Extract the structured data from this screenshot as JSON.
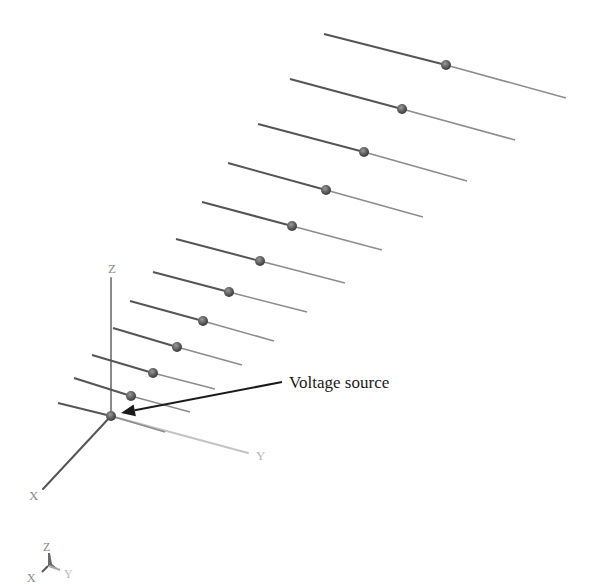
{
  "figure": {
    "annotation": {
      "label": "Voltage source",
      "text_pos": [
        289,
        388
      ],
      "arrow_from": [
        282,
        382
      ],
      "arrow_to": [
        121,
        413
      ]
    },
    "axes": {
      "origin": [
        111,
        416
      ],
      "z": {
        "label": "Z",
        "end": [
          111,
          278
        ],
        "label_pos": [
          108,
          273
        ]
      },
      "y": {
        "label": "Y",
        "end": [
          248,
          453
        ],
        "label_pos": [
          256,
          460
        ]
      },
      "x": {
        "label": "X",
        "end": [
          43,
          489
        ],
        "label_pos": [
          29,
          500
        ]
      }
    },
    "orientation_triad": {
      "z_label": "Z",
      "x_label": "X",
      "y_label": "Y"
    },
    "elements": [
      {
        "id": 1,
        "left": [
          324,
          34
        ],
        "feed": [
          446,
          65
        ],
        "right": [
          566,
          98
        ]
      },
      {
        "id": 2,
        "left": [
          290,
          79
        ],
        "feed": [
          402,
          109
        ],
        "right": [
          515,
          140
        ]
      },
      {
        "id": 3,
        "left": [
          258,
          124
        ],
        "feed": [
          364,
          152
        ],
        "right": [
          467,
          181
        ]
      },
      {
        "id": 4,
        "left": [
          228,
          163
        ],
        "feed": [
          326,
          190
        ],
        "right": [
          423,
          217
        ]
      },
      {
        "id": 5,
        "left": [
          202,
          202
        ],
        "feed": [
          292,
          226
        ],
        "right": [
          382,
          250
        ]
      },
      {
        "id": 6,
        "left": [
          176,
          239
        ],
        "feed": [
          260,
          261
        ],
        "right": [
          345,
          283
        ]
      },
      {
        "id": 7,
        "left": [
          153,
          272
        ],
        "feed": [
          229,
          292
        ],
        "right": [
          307,
          312
        ]
      },
      {
        "id": 8,
        "left": [
          130,
          301
        ],
        "feed": [
          203,
          321
        ],
        "right": [
          274,
          341
        ]
      },
      {
        "id": 9,
        "left": [
          113,
          328
        ],
        "feed": [
          177,
          347
        ],
        "right": [
          242,
          365
        ]
      },
      {
        "id": 10,
        "left": [
          92,
          355
        ],
        "feed": [
          153,
          373
        ],
        "right": [
          215,
          389
        ]
      },
      {
        "id": 11,
        "left": [
          74,
          378
        ],
        "feed": [
          131,
          396
        ],
        "right": [
          190,
          412
        ]
      },
      {
        "id": 12,
        "left": [
          58,
          403
        ],
        "feed": [
          111,
          416
        ],
        "right": [
          165,
          432
        ]
      }
    ],
    "colors": {
      "element_dark": "#555555",
      "element_light": "#8c8c8c",
      "feed_point": "#666666",
      "axis_z": "#8a8a8a",
      "axis_y": "#c4c4c4",
      "axis_x": "#555555",
      "arrow": "#1a1a1a"
    }
  }
}
